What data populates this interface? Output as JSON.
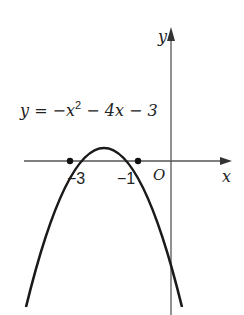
{
  "diagram": {
    "equation_label": "y = −x² − 4x − 3",
    "equation_parts": {
      "lhs": "y = −x",
      "exponent": "2",
      "rhs": " − 4x − 3"
    },
    "axes": {
      "x_label": "x",
      "y_label": "y",
      "origin_label": "O"
    },
    "roots": [
      {
        "label": "−3",
        "x": -3
      },
      {
        "label": "−1",
        "x": -1
      }
    ],
    "vertex": {
      "x": -2,
      "y": 1
    },
    "y_intercept": -3,
    "colors": {
      "curve": "#1a1a1a",
      "axis": "#555555",
      "text": "#222222"
    }
  }
}
